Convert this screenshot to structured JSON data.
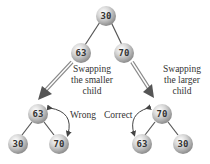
{
  "diagram": {
    "top_tree": {
      "root": "30",
      "left": "63",
      "right": "70"
    },
    "left_result": {
      "root": "63",
      "left": "30",
      "right": "70",
      "verdict": "Wrong"
    },
    "right_result": {
      "root": "70",
      "left": "63",
      "right": "30",
      "verdict": "Correct"
    },
    "left_caption": [
      "Swapping",
      "the smaller",
      "child"
    ],
    "right_caption": [
      "Swapping",
      "the larger",
      "child"
    ],
    "colors": {
      "node": "#c8c8c8",
      "edge": "#555555",
      "arrow": "#555555"
    }
  }
}
